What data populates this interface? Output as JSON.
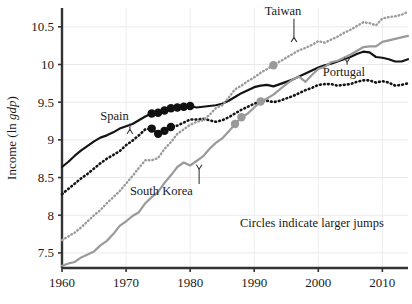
{
  "chart_data": {
    "type": "line",
    "title": "",
    "xlabel": "",
    "ylabel": "Income (ln gdp)",
    "ylabel_parts": {
      "prefix": "Income (ln ",
      "italic": "gdp",
      "suffix": ")"
    },
    "xlim": [
      1960,
      2014
    ],
    "ylim": [
      7.3,
      10.75
    ],
    "xticks": [
      1960,
      1970,
      1980,
      1990,
      2000,
      2010
    ],
    "xtick_labels": [
      "1960",
      "1970",
      "1980",
      "1990",
      "2000",
      "2010"
    ],
    "yticks": [
      7.5,
      8,
      8.5,
      9,
      9.5,
      10,
      10.5
    ],
    "ytick_labels": [
      "7.5",
      "8",
      "8.5",
      "9",
      "9.5",
      "10",
      "10.5"
    ],
    "grid": true,
    "legend": "none",
    "annotation_note": "Circles indicate larger jumps",
    "series": [
      {
        "name": "Spain",
        "style": "solid",
        "color": "#141414",
        "width": 2.2,
        "x": [
          1960,
          1961,
          1962,
          1963,
          1964,
          1965,
          1966,
          1967,
          1968,
          1969,
          1970,
          1971,
          1972,
          1973,
          1974,
          1975,
          1976,
          1977,
          1978,
          1979,
          1980,
          1981,
          1982,
          1983,
          1984,
          1985,
          1986,
          1987,
          1988,
          1989,
          1990,
          1991,
          1992,
          1993,
          1994,
          1995,
          1996,
          1997,
          1998,
          1999,
          2000,
          2001,
          2002,
          2003,
          2004,
          2005,
          2006,
          2007,
          2008,
          2009,
          2010,
          2011,
          2012,
          2013,
          2014
        ],
        "y": [
          8.64,
          8.71,
          8.79,
          8.86,
          8.92,
          8.98,
          9.03,
          9.06,
          9.1,
          9.15,
          9.18,
          9.21,
          9.26,
          9.31,
          9.35,
          9.36,
          9.39,
          9.42,
          9.43,
          9.44,
          9.45,
          9.43,
          9.44,
          9.45,
          9.46,
          9.48,
          9.52,
          9.57,
          9.62,
          9.66,
          9.7,
          9.72,
          9.73,
          9.71,
          9.74,
          9.77,
          9.8,
          9.84,
          9.88,
          9.92,
          9.96,
          9.99,
          10.01,
          10.04,
          10.07,
          10.1,
          10.14,
          10.17,
          10.16,
          10.1,
          10.09,
          10.07,
          10.04,
          10.04,
          10.07
        ]
      },
      {
        "name": "Portugal",
        "style": "dotted-thick",
        "color": "#141414",
        "width": 2.6,
        "x": [
          1960,
          1961,
          1962,
          1963,
          1964,
          1965,
          1966,
          1967,
          1968,
          1969,
          1970,
          1971,
          1972,
          1973,
          1974,
          1975,
          1976,
          1977,
          1978,
          1979,
          1980,
          1981,
          1982,
          1983,
          1984,
          1985,
          1986,
          1987,
          1988,
          1989,
          1990,
          1991,
          1992,
          1993,
          1994,
          1995,
          1996,
          1997,
          1998,
          1999,
          2000,
          2001,
          2002,
          2003,
          2004,
          2005,
          2006,
          2007,
          2008,
          2009,
          2010,
          2011,
          2012,
          2013,
          2014
        ],
        "y": [
          8.28,
          8.35,
          8.42,
          8.49,
          8.55,
          8.62,
          8.69,
          8.75,
          8.8,
          8.85,
          8.93,
          8.99,
          9.06,
          9.14,
          9.15,
          9.08,
          9.12,
          9.17,
          9.19,
          9.23,
          9.27,
          9.27,
          9.28,
          9.26,
          9.24,
          9.26,
          9.3,
          9.35,
          9.4,
          9.44,
          9.48,
          9.51,
          9.52,
          9.5,
          9.52,
          9.55,
          9.58,
          9.62,
          9.66,
          9.69,
          9.73,
          9.74,
          9.74,
          9.72,
          9.73,
          9.74,
          9.77,
          9.79,
          9.79,
          9.76,
          9.78,
          9.76,
          9.72,
          9.73,
          9.75
        ]
      },
      {
        "name": "Taiwan",
        "style": "dotted",
        "color": "#9a9a9a",
        "width": 2.4,
        "x": [
          1960,
          1961,
          1962,
          1963,
          1964,
          1965,
          1966,
          1967,
          1968,
          1969,
          1970,
          1971,
          1972,
          1973,
          1974,
          1975,
          1976,
          1977,
          1978,
          1979,
          1980,
          1981,
          1982,
          1983,
          1984,
          1985,
          1986,
          1987,
          1988,
          1989,
          1990,
          1991,
          1992,
          1993,
          1994,
          1995,
          1996,
          1997,
          1998,
          1999,
          2000,
          2001,
          2002,
          2003,
          2004,
          2005,
          2006,
          2007,
          2008,
          2009,
          2010,
          2011,
          2012,
          2013,
          2014
        ],
        "y": [
          7.67,
          7.72,
          7.77,
          7.84,
          7.92,
          8.0,
          8.07,
          8.16,
          8.24,
          8.32,
          8.42,
          8.52,
          8.63,
          8.73,
          8.73,
          8.76,
          8.88,
          8.97,
          9.08,
          9.14,
          9.2,
          9.24,
          9.26,
          9.33,
          9.42,
          9.46,
          9.56,
          9.67,
          9.72,
          9.78,
          9.83,
          9.89,
          9.94,
          9.99,
          10.04,
          10.09,
          10.14,
          10.19,
          10.22,
          10.26,
          10.31,
          10.29,
          10.33,
          10.37,
          10.42,
          10.46,
          10.51,
          10.56,
          10.55,
          10.52,
          10.61,
          10.63,
          10.64,
          10.66,
          10.7
        ]
      },
      {
        "name": "South Korea",
        "style": "solid",
        "color": "#9a9a9a",
        "width": 2.2,
        "x": [
          1960,
          1961,
          1962,
          1963,
          1964,
          1965,
          1966,
          1967,
          1968,
          1969,
          1970,
          1971,
          1972,
          1973,
          1974,
          1975,
          1976,
          1977,
          1978,
          1979,
          1980,
          1981,
          1982,
          1983,
          1984,
          1985,
          1986,
          1987,
          1988,
          1989,
          1990,
          1991,
          1992,
          1993,
          1994,
          1995,
          1996,
          1997,
          1998,
          1999,
          2000,
          2001,
          2002,
          2003,
          2004,
          2005,
          2006,
          2007,
          2008,
          2009,
          2010,
          2011,
          2012,
          2013,
          2014
        ],
        "y": [
          7.33,
          7.36,
          7.38,
          7.44,
          7.48,
          7.52,
          7.6,
          7.66,
          7.75,
          7.86,
          7.92,
          7.99,
          8.04,
          8.16,
          8.24,
          8.31,
          8.43,
          8.53,
          8.64,
          8.7,
          8.66,
          8.72,
          8.78,
          8.88,
          8.96,
          9.02,
          9.11,
          9.21,
          9.3,
          9.35,
          9.43,
          9.51,
          9.55,
          9.6,
          9.67,
          9.74,
          9.8,
          9.84,
          9.77,
          9.86,
          9.94,
          9.97,
          10.03,
          10.05,
          10.09,
          10.13,
          10.18,
          10.23,
          10.24,
          10.24,
          10.3,
          10.32,
          10.34,
          10.36,
          10.38
        ]
      }
    ],
    "markers": [
      {
        "series": "Spain",
        "x": 1974,
        "y": 9.35,
        "color": "#111111",
        "label": "larger-jump"
      },
      {
        "series": "Spain",
        "x": 1975,
        "y": 9.36,
        "color": "#111111",
        "label": "larger-jump"
      },
      {
        "series": "Spain",
        "x": 1976,
        "y": 9.39,
        "color": "#111111",
        "label": "larger-jump"
      },
      {
        "series": "Spain",
        "x": 1977,
        "y": 9.42,
        "color": "#111111",
        "label": "larger-jump"
      },
      {
        "series": "Spain",
        "x": 1978,
        "y": 9.43,
        "color": "#111111",
        "label": "larger-jump"
      },
      {
        "series": "Spain",
        "x": 1979,
        "y": 9.44,
        "color": "#111111",
        "label": "larger-jump"
      },
      {
        "series": "Spain",
        "x": 1980,
        "y": 9.45,
        "color": "#111111",
        "label": "larger-jump"
      },
      {
        "series": "Portugal",
        "x": 1974,
        "y": 9.15,
        "color": "#111111",
        "label": "larger-jump"
      },
      {
        "series": "Portugal",
        "x": 1975,
        "y": 9.08,
        "color": "#111111",
        "label": "larger-jump"
      },
      {
        "series": "Portugal",
        "x": 1976,
        "y": 9.12,
        "color": "#111111",
        "label": "larger-jump"
      },
      {
        "series": "Portugal",
        "x": 1977,
        "y": 9.17,
        "color": "#111111",
        "label": "larger-jump"
      },
      {
        "series": "South Korea",
        "x": 1987,
        "y": 9.21,
        "color": "#9a9a9a",
        "label": "larger-jump"
      },
      {
        "series": "South Korea",
        "x": 1988,
        "y": 9.3,
        "color": "#9a9a9a",
        "label": "larger-jump"
      },
      {
        "series": "South Korea",
        "x": 1991,
        "y": 9.51,
        "color": "#9a9a9a",
        "label": "larger-jump"
      },
      {
        "series": "Taiwan",
        "x": 1993,
        "y": 9.99,
        "color": "#9a9a9a",
        "label": "larger-jump"
      }
    ],
    "annotations": [
      {
        "text": "Spain",
        "name": "spain",
        "label_x": 1968.2,
        "label_y": 9.27,
        "tip_x": 1970.6,
        "tip_y": 9.14,
        "arrow": "down"
      },
      {
        "text": "Taiwan",
        "name": "taiwan",
        "label_x": 1994.5,
        "label_y": 10.66,
        "tip_x": 1996.2,
        "tip_y": 10.36,
        "arrow": "down"
      },
      {
        "text": "Portugal",
        "name": "portugal",
        "label_x": 2004.0,
        "label_y": 9.85,
        "tip_x": 2004.5,
        "tip_y": 10.03,
        "arrow": "up"
      },
      {
        "text": "South Korea",
        "name": "south-korea",
        "label_x": 1975.5,
        "label_y": 8.27,
        "tip_x": 1981.4,
        "tip_y": 8.61,
        "arrow": "up"
      }
    ]
  }
}
